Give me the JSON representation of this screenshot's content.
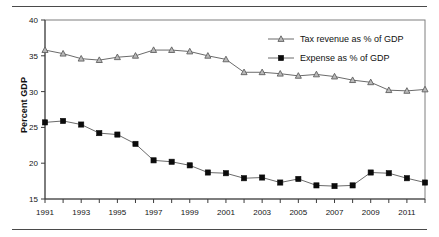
{
  "chart_data": {
    "type": "line",
    "title": "",
    "subtitle": "",
    "xlabel": "",
    "ylabel": "Percent GDP",
    "ylim": [
      15,
      40
    ],
    "y_ticks": [
      15,
      20,
      25,
      30,
      35,
      40
    ],
    "xlim": [
      1991,
      2012
    ],
    "x_ticks": [
      1991,
      1992,
      1993,
      1994,
      1995,
      1996,
      1997,
      1998,
      1999,
      2000,
      2001,
      2002,
      2003,
      2004,
      2005,
      2006,
      2007,
      2008,
      2009,
      2010,
      2011,
      2012
    ],
    "x_tick_labels": [
      "1991",
      "",
      "1993",
      "",
      "1995",
      "",
      "1997",
      "",
      "1999",
      "",
      "2001",
      "",
      "2003",
      "",
      "2005",
      "",
      "2007",
      "",
      "2009",
      "",
      "2011",
      ""
    ],
    "x": [
      1991,
      1992,
      1993,
      1994,
      1995,
      1996,
      1997,
      1998,
      1999,
      2000,
      2001,
      2002,
      2003,
      2004,
      2005,
      2006,
      2007,
      2008,
      2009,
      2010,
      2011,
      2012
    ],
    "grid": false,
    "legend_position": "top-right",
    "series": [
      {
        "name": "Tax revenue as % of GDP",
        "marker": "triangle",
        "marker_color": "#b9b9b9",
        "line_color": "#6b6b6b",
        "values": [
          35.8,
          35.3,
          34.6,
          34.4,
          34.8,
          35.0,
          35.8,
          35.8,
          35.6,
          35.0,
          34.5,
          32.7,
          32.7,
          32.5,
          32.2,
          32.4,
          32.1,
          31.6,
          31.3,
          30.2,
          30.1,
          30.3
        ]
      },
      {
        "name": "Expense as % of GDP",
        "marker": "square",
        "marker_color": "#0b0b0b",
        "line_color": "#6b6b6b",
        "values": [
          25.7,
          25.9,
          25.4,
          24.2,
          24.0,
          22.7,
          20.4,
          20.2,
          19.7,
          18.7,
          18.6,
          17.9,
          18.0,
          17.3,
          17.8,
          16.9,
          16.8,
          16.9,
          18.7,
          18.6,
          17.9,
          17.3
        ]
      }
    ]
  },
  "legend": {
    "entries": [
      {
        "label": "Tax revenue as % of GDP"
      },
      {
        "label": "Expense as % of GDP"
      }
    ]
  },
  "axes": {
    "y_title": "Percent GDP"
  }
}
